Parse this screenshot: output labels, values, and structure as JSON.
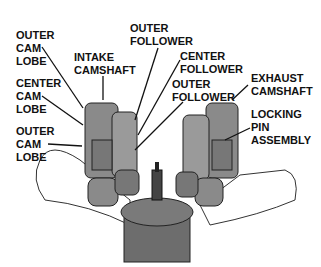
{
  "labels": {
    "outer_cam_lobe_top": "OUTER\nCAM\nLOBE",
    "intake_camshaft": "INTAKE\nCAMSHAFT",
    "outer_follower_top": "OUTER\nFOLLOWER",
    "center_follower": "CENTER\nFOLLOWER",
    "outer_follower_mid": "OUTER\nFOLLOWER",
    "exhaust_camshaft": "EXHAUST\nCAMSHAFT",
    "center_cam_lobe": "CENTER\nCAM\nLOBE",
    "locking_pin_assembly": "LOCKING\nPIN\nASSEMBLY",
    "outer_cam_lobe_bottom": "OUTER\nCAM\nLOBE"
  },
  "colors": {
    "part_fill": "#8a8a8a",
    "part_dark": "#555555",
    "outline": "#222222",
    "manifold": "#ffffff"
  }
}
